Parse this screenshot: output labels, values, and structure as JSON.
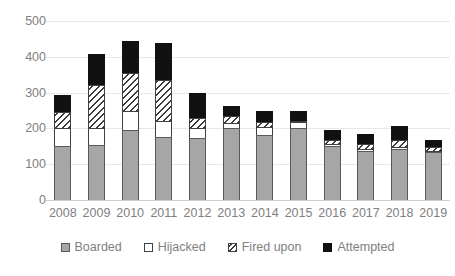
{
  "chart_data": {
    "type": "bar",
    "subtype": "stacked-vertical",
    "title": "",
    "subtitle": "",
    "xlabel": "",
    "ylabel": "",
    "categories": [
      "2008",
      "2009",
      "2010",
      "2011",
      "2012",
      "2013",
      "2014",
      "2015",
      "2016",
      "2017",
      "2018",
      "2019"
    ],
    "series": [
      {
        "name": "Boarded",
        "color": "#a6a6a6",
        "pattern": "solid",
        "values": [
          151,
          153,
          196,
          176,
          174,
          202,
          183,
          203,
          150,
          136,
          143,
          134
        ]
      },
      {
        "name": "Hijacked",
        "color": "#ffffff",
        "pattern": "solid",
        "values": [
          49,
          49,
          53,
          45,
          28,
          12,
          21,
          15,
          7,
          6,
          6,
          4
        ]
      },
      {
        "name": "Fired upon",
        "color": "#ffffff",
        "pattern": "hatch",
        "values": [
          46,
          120,
          107,
          113,
          28,
          22,
          13,
          2,
          12,
          15,
          18,
          11
        ]
      },
      {
        "name": "Attempted",
        "color": "#111111",
        "pattern": "solid",
        "values": [
          47,
          85,
          89,
          105,
          69,
          28,
          31,
          29,
          27,
          27,
          39,
          20
        ]
      }
    ],
    "totals": [
      293,
      407,
      445,
      439,
      299,
      264,
      248,
      249,
      196,
      184,
      206,
      169
    ],
    "ylim": [
      0,
      500
    ],
    "ytick_values": [
      0,
      100,
      200,
      300,
      400,
      500
    ],
    "ytick_labels": [
      "0",
      "100",
      "200",
      "300",
      "400",
      "500"
    ],
    "grid": true,
    "grid_axis": "y",
    "legend_position": "bottom"
  },
  "axis": {
    "y_labels": [
      "500",
      "400",
      "300",
      "200",
      "100",
      "0"
    ],
    "x_labels": [
      "2008",
      "2009",
      "2010",
      "2011",
      "2012",
      "2013",
      "2014",
      "2015",
      "2016",
      "2017",
      "2018",
      "2019"
    ]
  },
  "legend": {
    "items": [
      {
        "label": "Boarded",
        "swatch": "gray-square-icon"
      },
      {
        "label": "Hijacked",
        "swatch": "white-square-icon"
      },
      {
        "label": "Fired upon",
        "swatch": "hatched-square-icon"
      },
      {
        "label": "Attempted",
        "swatch": "black-square-icon"
      }
    ]
  },
  "colors": {
    "boarded": "#a6a6a6",
    "hijacked": "#ffffff",
    "fired_upon": "#ffffff",
    "attempted": "#111111",
    "grid": "#e8e8e8",
    "text": "#808080",
    "background": "#ffffff"
  }
}
